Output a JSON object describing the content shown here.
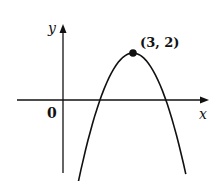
{
  "chart_data": {
    "type": "line",
    "title": "",
    "xlabel": "x",
    "ylabel": "y",
    "origin_label": "0",
    "function": "y = 2 - (x - 3)^2",
    "series": [
      {
        "name": "parabola",
        "x": [
          -0.73,
          1.59,
          3,
          4.41,
          5.27
        ],
        "y": [
          -3.2,
          0,
          2,
          0,
          -3.2
        ]
      }
    ],
    "annotations": [
      {
        "text": "(3, 2)",
        "x": 3,
        "y": 2,
        "marker": "filled-circle"
      }
    ],
    "xlim": [
      -2,
      6.3
    ],
    "ylim": [
      -3.1,
      3.2
    ],
    "grid": false,
    "legend": null,
    "colors": {
      "curve": "#111111",
      "axes": "#111111",
      "background": "#ffffff"
    }
  }
}
